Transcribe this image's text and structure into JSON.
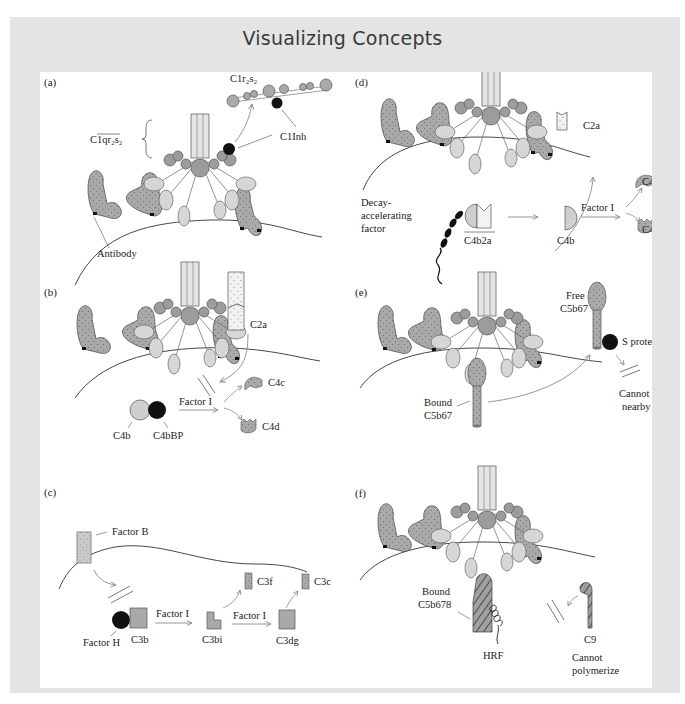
{
  "title": "Visualizing Concepts",
  "colors": {
    "frame": "#e4e4e4",
    "panel": "#ffffff",
    "antibody": "#a9a9a9",
    "c1q_light": "#d6d6d6",
    "c1q_dark": "#9c9c9c",
    "black": "#111111",
    "arrow": "#8a8a8a"
  },
  "panels": {
    "a": {
      "label": "(a)",
      "c1r2s2": "C1r₂s₂",
      "c1qr2s2": "C1qr₂s₂",
      "c1inh": "C1Inh",
      "antibody": "Antibody"
    },
    "b": {
      "label": "(b)",
      "c2a": "C2a",
      "factor_i": "Factor I",
      "c4b": "C4b",
      "c4bbp": "C4bBP",
      "c4c": "C4c",
      "c4d": "C4d"
    },
    "c": {
      "label": "(c)",
      "factor_b": "Factor B",
      "factor_h": "Factor H",
      "c3b": "C3b",
      "factor_i_1": "Factor I",
      "c3bi": "C3bi",
      "factor_i_2": "Factor I",
      "c3dg": "C3dg",
      "c3f": "C3f",
      "c3c": "C3c"
    },
    "d": {
      "label": "(d)",
      "daf_1": "Decay-",
      "daf_2": "accelerating",
      "daf_3": "factor",
      "c4b2a": "C4b2a",
      "c4b": "C4b",
      "factor_i": "Factor I",
      "c2a": "C2a",
      "c4c": "C4c",
      "c4d": "C4d"
    },
    "e": {
      "label": "(e)",
      "free_1": "Free",
      "free_2": "C5b67",
      "s_protein": "S protein",
      "bound_1": "Bound",
      "bound_2": "C5b67",
      "cannot_1": "Cannot attack",
      "cannot_2": "nearby cells"
    },
    "f": {
      "label": "(f)",
      "bound_1": "Bound",
      "bound_2": "C5b678",
      "hrf": "HRF",
      "c9": "C9",
      "cannot_1": "Cannot",
      "cannot_2": "polymerize"
    }
  }
}
